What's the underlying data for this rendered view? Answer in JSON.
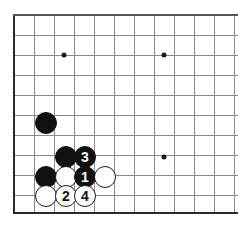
{
  "figure": {
    "board_size": 19,
    "view": "bottom-left corner",
    "background_color": "#ffffff",
    "grid_color": "#8a8a8a",
    "edge_color": "#2b2b2b",
    "black_stone_color": "#111111",
    "white_stone_color": "#ffffff"
  },
  "geometry": {
    "origin_x": 14,
    "origin_y": 15,
    "spacing": 20,
    "cols": 12,
    "rows": 10,
    "stone_diameter": 22,
    "left_edge_x": 14,
    "top_edge_y": 15,
    "bottom_edge_y": 212
  },
  "grid": {
    "vertical_x": [
      14,
      34,
      54,
      74,
      94,
      114,
      134,
      154,
      174,
      194,
      214,
      234
    ],
    "horizontal_y": [
      15,
      35,
      55,
      75,
      95,
      115,
      135,
      155,
      175,
      195,
      212
    ]
  },
  "star_points": [
    {
      "name": "hoshi-upper-left",
      "x": 64,
      "y": 55
    },
    {
      "name": "hoshi-upper-right",
      "x": 164,
      "y": 55
    },
    {
      "name": "hoshi-lower-right",
      "x": 164,
      "y": 157
    }
  ],
  "stones": [
    {
      "name": "black-stone-corner-approach",
      "color": "black",
      "x": 46,
      "y": 123,
      "label": ""
    },
    {
      "name": "black-stone-unnumbered-upper",
      "color": "black",
      "x": 66,
      "y": 157,
      "label": ""
    },
    {
      "name": "black-stone-move-3",
      "color": "black",
      "x": 85,
      "y": 157,
      "label": "3"
    },
    {
      "name": "black-stone-unnumbered-left",
      "color": "black",
      "x": 46,
      "y": 177,
      "label": ""
    },
    {
      "name": "white-stone-unnumbered-middle",
      "color": "white",
      "x": 66,
      "y": 177,
      "label": ""
    },
    {
      "name": "black-stone-move-1",
      "color": "black",
      "x": 85,
      "y": 177,
      "label": "1"
    },
    {
      "name": "white-stone-unnumbered-right",
      "color": "white",
      "x": 105,
      "y": 177,
      "label": ""
    },
    {
      "name": "white-stone-unnumbered-bottom-left",
      "color": "white",
      "x": 46,
      "y": 196,
      "label": ""
    },
    {
      "name": "white-stone-move-2",
      "color": "white",
      "x": 66,
      "y": 196,
      "label": "2"
    },
    {
      "name": "white-stone-move-4",
      "color": "white",
      "x": 85,
      "y": 196,
      "label": "4"
    }
  ]
}
